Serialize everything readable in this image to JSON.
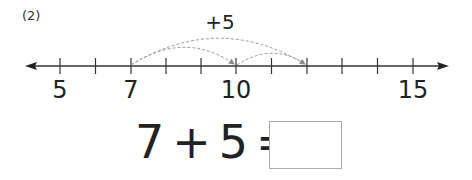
{
  "problem": {
    "label": "(2)"
  },
  "number_line": {
    "start": 5,
    "end": 15,
    "labeled_ticks": [
      {
        "value": 5,
        "text": "5",
        "x": 60
      },
      {
        "value": 7,
        "text": "7",
        "x": 131
      },
      {
        "value": 10,
        "text": "10",
        "x": 236
      },
      {
        "value": 15,
        "text": "15",
        "x": 413
      }
    ],
    "jump": {
      "from": 7,
      "to": 12,
      "label": "+5"
    },
    "colors": {
      "axis": "#333333",
      "arc": "#999999"
    }
  },
  "equation": {
    "a": "7",
    "op": "+",
    "b": "5",
    "eq": "=",
    "answer": ""
  }
}
